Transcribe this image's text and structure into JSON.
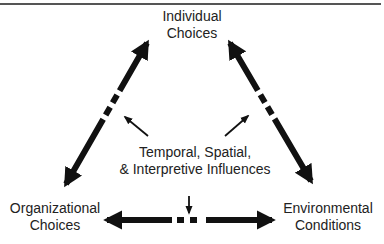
{
  "nodes": {
    "top": [
      "Individual",
      "Choices"
    ],
    "left": [
      "Organizational",
      "Choices"
    ],
    "right": [
      "Environmental",
      "Conditions"
    ],
    "center": [
      "Temporal, Spatial,",
      "& Interpretive Influences"
    ]
  },
  "edges": [
    {
      "from": "top",
      "to": "left",
      "style": "bidirectional-dashed"
    },
    {
      "from": "top",
      "to": "right",
      "style": "bidirectional-dashed"
    },
    {
      "from": "left",
      "to": "right",
      "style": "bidirectional-dashed"
    }
  ],
  "influence_arrows": [
    {
      "from": "center",
      "toward": "edge-top-left"
    },
    {
      "from": "center",
      "toward": "edge-top-right"
    },
    {
      "from": "center",
      "toward": "edge-left-right"
    }
  ],
  "colors": {
    "ink": "#111111",
    "text": "#222222",
    "rule": "#555555"
  }
}
